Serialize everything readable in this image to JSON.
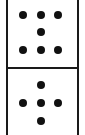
{
  "domino": {
    "top_value": 7,
    "bottom_value": 5,
    "top_pips": [
      {
        "x": 23,
        "y": 15
      },
      {
        "x": 41,
        "y": 15
      },
      {
        "x": 58,
        "y": 15
      },
      {
        "x": 41,
        "y": 32
      },
      {
        "x": 23,
        "y": 50
      },
      {
        "x": 41,
        "y": 50
      },
      {
        "x": 58,
        "y": 50
      }
    ],
    "bottom_pips": [
      {
        "x": 41,
        "y": 85
      },
      {
        "x": 23,
        "y": 103
      },
      {
        "x": 41,
        "y": 103
      },
      {
        "x": 58,
        "y": 103
      },
      {
        "x": 41,
        "y": 121
      }
    ],
    "colors": {
      "pip": "#111111",
      "border": "#1a1a1a",
      "face": "#ffffff"
    }
  }
}
